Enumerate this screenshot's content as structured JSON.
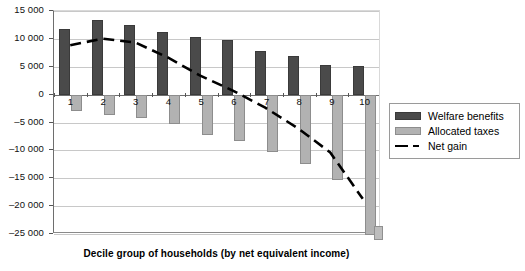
{
  "chart_data": {
    "type": "bar",
    "title": "",
    "subtitle": "",
    "xlabel": "Decile group of households (by net equivalent income)",
    "ylabel": "",
    "categories": [
      "1",
      "2",
      "3",
      "4",
      "5",
      "6",
      "7",
      "8",
      "9",
      "10"
    ],
    "ylim": [
      -25000,
      15000
    ],
    "ytick_values": [
      15000,
      10000,
      5000,
      0,
      -5000,
      -10000,
      -15000,
      -20000,
      -25000
    ],
    "ytick_labels": [
      "15 000",
      "10 000",
      "5 000",
      "0",
      "–5 000",
      "–10 000",
      "–15 000",
      "–20 000",
      "–25 000"
    ],
    "grid": true,
    "legend_position": "right",
    "series": [
      {
        "name": "Welfare benefits",
        "type": "bar",
        "color": "#4a4a4a",
        "values": [
          11800,
          13400,
          12500,
          11300,
          10400,
          9800,
          7900,
          6900,
          5400,
          5200
        ]
      },
      {
        "name": "Allocated taxes",
        "type": "bar",
        "color": "#b2b2b2",
        "values": [
          -3000,
          -3600,
          -4200,
          -5200,
          -7300,
          -8300,
          -10300,
          -12500,
          -15400,
          -25200
        ]
      },
      {
        "name": "Net gain",
        "type": "line",
        "style": "dashed",
        "color": "#000000",
        "values": [
          8800,
          10000,
          9300,
          6600,
          3300,
          600,
          -2500,
          -6200,
          -10600,
          -19000
        ]
      }
    ]
  },
  "legend": {
    "items": [
      {
        "label": "Welfare benefits",
        "swatch": "benefit"
      },
      {
        "label": "Allocated taxes",
        "swatch": "tax"
      },
      {
        "label": "Net gain",
        "swatch": "netgain"
      }
    ]
  },
  "axis": {
    "x_title": "Decile group of households (by net equivalent income)"
  }
}
